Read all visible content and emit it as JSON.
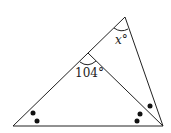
{
  "diagram": {
    "labels": {
      "angle_x": "x°",
      "angle_104": "104°"
    },
    "markers": {
      "bottom_left_dots": 2,
      "bottom_right_dots": 3
    }
  }
}
